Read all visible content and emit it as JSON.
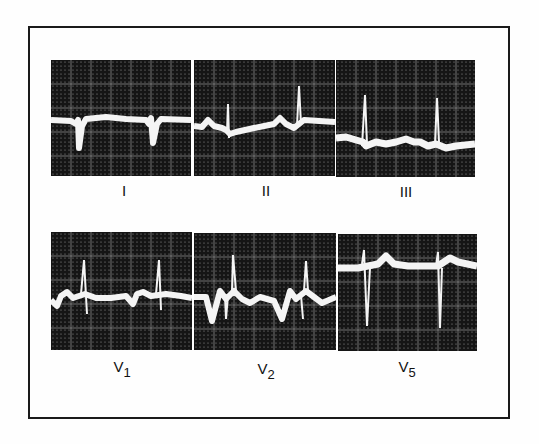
{
  "figure": {
    "frame_color": "#1a1a1a",
    "grid_background": "#151515",
    "trace_color": "#f4f4f4",
    "leads": [
      {
        "id": "I",
        "label": "I",
        "sub": ""
      },
      {
        "id": "II",
        "label": "II",
        "sub": ""
      },
      {
        "id": "III",
        "label": "III",
        "sub": ""
      },
      {
        "id": "V1",
        "label": "V",
        "sub": "1"
      },
      {
        "id": "V2",
        "label": "V",
        "sub": "2"
      },
      {
        "id": "V5",
        "label": "V",
        "sub": "5"
      }
    ]
  }
}
